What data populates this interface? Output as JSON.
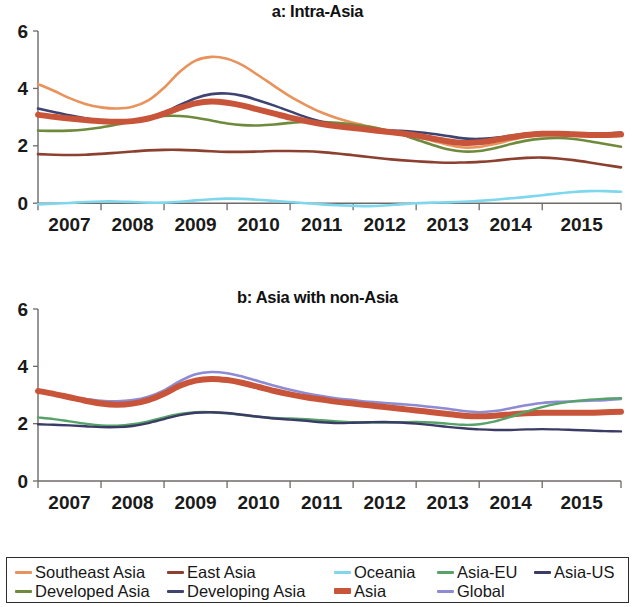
{
  "figure": {
    "background": "#ffffff",
    "axis_color": "#6e6a68"
  },
  "legend": {
    "items": [
      {
        "label": "Southeast Asia",
        "color": "#E8935C",
        "thick": false,
        "x": 8,
        "y": 6
      },
      {
        "label": "East Asia",
        "color": "#8C4130",
        "thick": false,
        "x": 160,
        "y": 6
      },
      {
        "label": "Oceania",
        "color": "#7FD7EE",
        "thick": false,
        "x": 327,
        "y": 6
      },
      {
        "label": "Asia-EU",
        "color": "#56A269",
        "thick": false,
        "x": 430,
        "y": 6
      },
      {
        "label": "Asia-US",
        "color": "#3B3C66",
        "thick": false,
        "x": 527,
        "y": 6
      },
      {
        "label": "Developed Asia",
        "color": "#6E8A3C",
        "thick": false,
        "x": 8,
        "y": 25
      },
      {
        "label": "Developing Asia",
        "color": "#3F4370",
        "thick": false,
        "x": 160,
        "y": 25
      },
      {
        "label": "Asia",
        "color": "#C8553A",
        "thick": true,
        "x": 327,
        "y": 25
      },
      {
        "label": "Global",
        "color": "#8C8BD4",
        "thick": false,
        "x": 430,
        "y": 25
      }
    ]
  },
  "chart_data": [
    {
      "id": "a",
      "type": "line",
      "title": "a: Intra-Asia",
      "xlabel": "",
      "ylabel": "",
      "grid": false,
      "legend_position": "bottom",
      "ylim": [
        -0.55,
        6
      ],
      "yticks": [
        0,
        2,
        4,
        6
      ],
      "ytick_labels": [
        "0",
        "2",
        "4",
        "6"
      ],
      "xlim": [
        2006.5,
        2015.75
      ],
      "xticks": [
        2006.5,
        2007.5,
        2008.5,
        2009.5,
        2010.5,
        2011.5,
        2012.5,
        2013.5,
        2014.5,
        2015.75
      ],
      "xtick_labels": [
        "2007",
        "2008",
        "2009",
        "2010",
        "2011",
        "2012",
        "2013",
        "2014",
        "2015"
      ],
      "x": [
        2006.5,
        2006.75,
        2007.0,
        2007.25,
        2007.5,
        2007.75,
        2008.0,
        2008.25,
        2008.5,
        2008.75,
        2009.0,
        2009.25,
        2009.5,
        2009.75,
        2010.0,
        2010.25,
        2010.5,
        2010.75,
        2011.0,
        2011.25,
        2011.5,
        2011.75,
        2012.0,
        2012.25,
        2012.5,
        2012.75,
        2013.0,
        2013.25,
        2013.5,
        2013.75,
        2014.0,
        2014.25,
        2014.5,
        2014.75,
        2015.0,
        2015.25,
        2015.5,
        2015.75
      ],
      "series": [
        {
          "name": "Southeast Asia",
          "color": "#E8935C",
          "width": 2.6,
          "values": [
            4.15,
            3.92,
            3.66,
            3.46,
            3.34,
            3.3,
            3.36,
            3.58,
            4.02,
            4.58,
            4.97,
            5.1,
            5.03,
            4.8,
            4.45,
            4.08,
            3.72,
            3.42,
            3.16,
            2.96,
            2.8,
            2.68,
            2.56,
            2.44,
            2.32,
            2.18,
            2.04,
            1.94,
            1.96,
            2.06,
            2.2,
            2.32,
            2.38,
            2.38,
            2.35,
            2.33,
            2.33,
            2.34
          ]
        },
        {
          "name": "East Asia",
          "color": "#8C4130",
          "width": 2.6,
          "values": [
            1.71,
            1.69,
            1.68,
            1.69,
            1.72,
            1.76,
            1.8,
            1.84,
            1.86,
            1.86,
            1.84,
            1.81,
            1.79,
            1.79,
            1.8,
            1.82,
            1.82,
            1.81,
            1.78,
            1.73,
            1.67,
            1.61,
            1.55,
            1.5,
            1.46,
            1.43,
            1.41,
            1.42,
            1.44,
            1.48,
            1.54,
            1.58,
            1.59,
            1.56,
            1.5,
            1.42,
            1.33,
            1.25
          ]
        },
        {
          "name": "Oceania",
          "color": "#7FD7EE",
          "width": 2.6,
          "values": [
            -0.04,
            -0.02,
            0.01,
            0.04,
            0.06,
            0.06,
            0.04,
            0.02,
            0.02,
            0.05,
            0.1,
            0.14,
            0.16,
            0.15,
            0.12,
            0.08,
            0.04,
            0.0,
            -0.04,
            -0.07,
            -0.09,
            -0.1,
            -0.08,
            -0.04,
            0.0,
            0.02,
            0.03,
            0.05,
            0.08,
            0.12,
            0.17,
            0.22,
            0.28,
            0.34,
            0.39,
            0.42,
            0.42,
            0.4
          ]
        },
        {
          "name": "Developed Asia",
          "color": "#6E8A3C",
          "width": 2.6,
          "values": [
            2.53,
            2.52,
            2.53,
            2.57,
            2.64,
            2.74,
            2.86,
            2.97,
            3.04,
            3.04,
            2.98,
            2.88,
            2.78,
            2.72,
            2.71,
            2.74,
            2.8,
            2.84,
            2.84,
            2.8,
            2.74,
            2.66,
            2.55,
            2.4,
            2.22,
            2.04,
            1.88,
            1.8,
            1.82,
            1.92,
            2.06,
            2.18,
            2.25,
            2.27,
            2.24,
            2.16,
            2.06,
            1.97
          ]
        },
        {
          "name": "Developing Asia",
          "color": "#3F4370",
          "width": 2.6,
          "values": [
            3.3,
            3.18,
            3.06,
            2.96,
            2.88,
            2.84,
            2.86,
            2.96,
            3.16,
            3.42,
            3.66,
            3.8,
            3.82,
            3.74,
            3.58,
            3.4,
            3.2,
            3.0,
            2.84,
            2.72,
            2.64,
            2.58,
            2.54,
            2.52,
            2.48,
            2.42,
            2.34,
            2.26,
            2.24,
            2.28,
            2.35,
            2.42,
            2.46,
            2.45,
            2.43,
            2.42,
            2.43,
            2.46
          ]
        },
        {
          "name": "Asia",
          "color": "#C8553A",
          "width": 6.0,
          "values": [
            3.08,
            3.01,
            2.95,
            2.9,
            2.86,
            2.84,
            2.86,
            2.95,
            3.12,
            3.32,
            3.48,
            3.54,
            3.5,
            3.4,
            3.26,
            3.12,
            2.98,
            2.86,
            2.76,
            2.68,
            2.62,
            2.56,
            2.5,
            2.44,
            2.36,
            2.26,
            2.16,
            2.1,
            2.12,
            2.2,
            2.3,
            2.38,
            2.42,
            2.42,
            2.4,
            2.38,
            2.38,
            2.4
          ]
        }
      ]
    },
    {
      "id": "b",
      "type": "line",
      "title": "b: Asia with non-Asia",
      "xlabel": "",
      "ylabel": "",
      "grid": false,
      "legend_position": "bottom",
      "ylim": [
        0,
        6
      ],
      "yticks": [
        0,
        2,
        4,
        6
      ],
      "ytick_labels": [
        "0",
        "2",
        "4",
        "6"
      ],
      "xlim": [
        2006.5,
        2015.75
      ],
      "xticks": [
        2006.5,
        2007.5,
        2008.5,
        2009.5,
        2010.5,
        2011.5,
        2012.5,
        2013.5,
        2014.5,
        2015.75
      ],
      "xtick_labels": [
        "2007",
        "2008",
        "2009",
        "2010",
        "2011",
        "2012",
        "2013",
        "2014",
        "2015"
      ],
      "x": [
        2006.5,
        2006.75,
        2007.0,
        2007.25,
        2007.5,
        2007.75,
        2008.0,
        2008.25,
        2008.5,
        2008.75,
        2009.0,
        2009.25,
        2009.5,
        2009.75,
        2010.0,
        2010.25,
        2010.5,
        2010.75,
        2011.0,
        2011.25,
        2011.5,
        2011.75,
        2012.0,
        2012.25,
        2012.5,
        2012.75,
        2013.0,
        2013.25,
        2013.5,
        2013.75,
        2014.0,
        2014.25,
        2014.5,
        2014.75,
        2015.0,
        2015.25,
        2015.5,
        2015.75
      ],
      "series": [
        {
          "name": "Global",
          "color": "#8C8BD4",
          "width": 2.6,
          "values": [
            3.14,
            3.04,
            2.94,
            2.86,
            2.8,
            2.78,
            2.82,
            2.94,
            3.16,
            3.48,
            3.72,
            3.8,
            3.76,
            3.64,
            3.48,
            3.32,
            3.18,
            3.06,
            2.96,
            2.88,
            2.82,
            2.76,
            2.72,
            2.68,
            2.64,
            2.58,
            2.52,
            2.44,
            2.4,
            2.44,
            2.54,
            2.64,
            2.72,
            2.76,
            2.78,
            2.8,
            2.82,
            2.86
          ]
        },
        {
          "name": "Asia",
          "color": "#C8553A",
          "width": 6.0,
          "values": [
            3.14,
            3.04,
            2.92,
            2.8,
            2.7,
            2.66,
            2.7,
            2.82,
            3.04,
            3.32,
            3.5,
            3.56,
            3.52,
            3.42,
            3.28,
            3.14,
            3.02,
            2.92,
            2.84,
            2.76,
            2.7,
            2.64,
            2.58,
            2.52,
            2.46,
            2.4,
            2.34,
            2.28,
            2.26,
            2.28,
            2.32,
            2.36,
            2.38,
            2.38,
            2.38,
            2.38,
            2.4,
            2.42
          ]
        },
        {
          "name": "Asia-EU",
          "color": "#56A269",
          "width": 2.4,
          "values": [
            2.22,
            2.16,
            2.08,
            2.0,
            1.94,
            1.93,
            1.98,
            2.08,
            2.22,
            2.34,
            2.4,
            2.4,
            2.36,
            2.3,
            2.24,
            2.2,
            2.18,
            2.16,
            2.12,
            2.08,
            2.05,
            2.04,
            2.04,
            2.05,
            2.06,
            2.04,
            2.0,
            1.96,
            1.98,
            2.08,
            2.24,
            2.42,
            2.58,
            2.7,
            2.78,
            2.84,
            2.87,
            2.89
          ]
        },
        {
          "name": "Asia-US",
          "color": "#3B3C66",
          "width": 2.4,
          "values": [
            1.98,
            1.96,
            1.94,
            1.91,
            1.88,
            1.88,
            1.92,
            2.02,
            2.16,
            2.3,
            2.38,
            2.4,
            2.37,
            2.31,
            2.24,
            2.18,
            2.14,
            2.1,
            2.05,
            2.02,
            2.03,
            2.05,
            2.06,
            2.04,
            2.0,
            1.95,
            1.89,
            1.84,
            1.8,
            1.78,
            1.78,
            1.8,
            1.81,
            1.8,
            1.78,
            1.76,
            1.74,
            1.73
          ]
        }
      ]
    }
  ]
}
